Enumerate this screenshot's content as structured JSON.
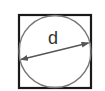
{
  "diagram": {
    "label": "d",
    "shapes": {
      "square": {
        "x": 19,
        "y": 15,
        "width": 72,
        "height": 73,
        "stroke": "#1a1a1a"
      },
      "circle": {
        "cx": 55,
        "cy": 51.5,
        "r": 36,
        "stroke": "#777777"
      },
      "diameter_arrow": {
        "x1": 20,
        "y1": 60,
        "x2": 89,
        "y2": 43,
        "stroke": "#555555"
      }
    },
    "colors": {
      "background": "#ffffff",
      "square_stroke": "#1a1a1a",
      "circle_stroke": "#777777",
      "arrow_stroke": "#555555",
      "label_color": "#333333"
    }
  }
}
